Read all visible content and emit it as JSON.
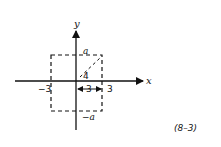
{
  "figure": {
    "axis_labels": {
      "x": "x",
      "y": "y"
    },
    "box_labels": {
      "top": "a",
      "bottom": "−a"
    },
    "tick_labels": {
      "left": "−3",
      "right": "3"
    },
    "diagonal_label": "4",
    "half_width_label": "3",
    "equation_number": "(8–3)"
  }
}
